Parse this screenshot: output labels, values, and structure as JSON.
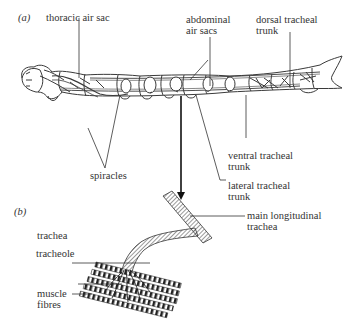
{
  "figure": {
    "panel_a": {
      "label": "(a)",
      "labels": {
        "thoracic_air_sac": "thoracic air sac",
        "abdominal_air_sacs": "abdominal\nair sacs",
        "dorsal_tracheal_trunk": "dorsal tracheal\ntrunk",
        "spiracles": "spiracles",
        "ventral_tracheal_trunk": "ventral tracheal\ntrunk",
        "lateral_tracheal_trunk": "lateral tracheal\ntrunk"
      }
    },
    "panel_b": {
      "label": "(b)",
      "labels": {
        "main_longitudinal_trachea": "main longitudinal\ntrachea",
        "trachea": "trachea",
        "tracheole": "tracheole",
        "muscle_fibres": "muscle\nfibres"
      }
    },
    "colors": {
      "line": "#3a3a3a",
      "fill": "#ffffff",
      "hatch": "#555555"
    }
  }
}
